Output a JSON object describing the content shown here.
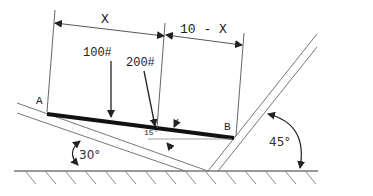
{
  "diagram": {
    "type": "statics free-body setup",
    "labels": {
      "dim_x": "X",
      "dim_10_minus_x": "10 - X",
      "load_1": "100#",
      "load_2": "200#",
      "point_a": "A",
      "point_b": "B",
      "beam_angle": "15°",
      "left_incline_angle": "30°",
      "right_incline_angle": "45°"
    },
    "colors": {
      "line": "#555555",
      "beam": "#111111",
      "ground": "#999999"
    }
  }
}
